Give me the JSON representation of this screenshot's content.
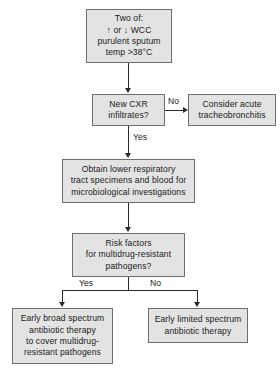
{
  "diagram": {
    "colors": {
      "node_fill": "#e3e3e3",
      "node_border": "#6e6e6e",
      "edge": "#2b2b2b",
      "text": "#1a1a1a",
      "background": "#ffffff"
    },
    "nodes": {
      "criteria": {
        "id": "criteria",
        "shape": "rectangle",
        "text": "Two of:\n↑ or ↓ WCC\npurulent sputum\ntemp >38°C",
        "lines": [
          "Two of:",
          "↑ or ↓ WCC",
          "purulent sputum",
          "temp >38°C"
        ]
      },
      "cxr_decision": {
        "id": "cxr-decision",
        "shape": "rectangle",
        "text": "New CXR\ninfiltrates?",
        "lines": [
          "New CXR",
          "infiltrates?"
        ]
      },
      "tracheobronchitis": {
        "id": "tracheobronchitis",
        "shape": "rectangle",
        "text": "Consider acute\ntracheobronchitis",
        "lines": [
          "Consider acute",
          "tracheobronchitis"
        ]
      },
      "specimens": {
        "id": "specimens",
        "shape": "rectangle",
        "text": "Obtain lower respiratory\ntract specimens and blood for\nmicrobiological investigations",
        "lines": [
          "Obtain lower respiratory",
          "tract specimens and blood for",
          "microbiological investigations"
        ]
      },
      "risk_decision": {
        "id": "risk-decision",
        "shape": "rectangle",
        "text": "Risk factors\nfor multidrug-resistant\npathogens?",
        "lines": [
          "Risk factors",
          "for multidrug-resistant",
          "pathogens?"
        ]
      },
      "broad_spectrum": {
        "id": "broad-spectrum",
        "shape": "rectangle",
        "text": "Early broad spectrum\nantibiotic therapy\nto cover multidrug-\nresistant pathogens",
        "lines": [
          "Early broad spectrum",
          "antibiotic therapy",
          "to cover multidrug-",
          "resistant pathogens"
        ]
      },
      "limited_spectrum": {
        "id": "limited-spectrum",
        "shape": "rectangle",
        "text": "Early limited spectrum\nantibiotic therapy",
        "lines": [
          "Early limited spectrum",
          "antibiotic therapy"
        ]
      }
    },
    "edge_labels": {
      "cxr_no": "No",
      "cxr_yes": "Yes",
      "risk_yes": "Yes",
      "risk_no": "No"
    },
    "edges": [
      {
        "from": "criteria",
        "to": "cxr_decision",
        "label": ""
      },
      {
        "from": "cxr_decision",
        "to": "tracheobronchitis",
        "label": "No"
      },
      {
        "from": "cxr_decision",
        "to": "specimens",
        "label": "Yes"
      },
      {
        "from": "specimens",
        "to": "risk_decision",
        "label": ""
      },
      {
        "from": "risk_decision",
        "to": "broad_spectrum",
        "label": "Yes"
      },
      {
        "from": "risk_decision",
        "to": "limited_spectrum",
        "label": "No"
      }
    ]
  }
}
